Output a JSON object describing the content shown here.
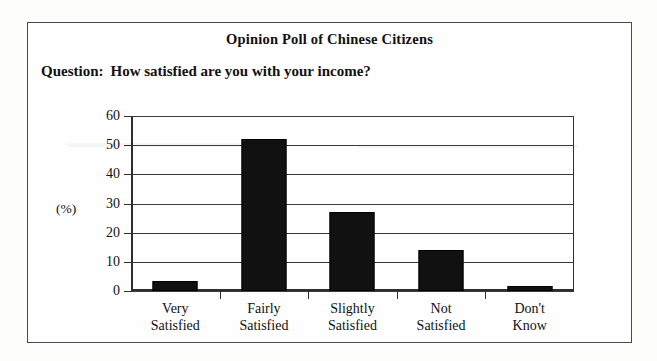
{
  "chart_data": {
    "type": "bar",
    "title": "Opinion Poll of Chinese Citizens",
    "subtitle_label": "Question:",
    "subtitle_text": "How satisfied are you with your income?",
    "categories": [
      "Very Satisfied",
      "Fairly Satisfied",
      "Slightly Satisfied",
      "Not Satisfied",
      "Don't Know"
    ],
    "category_lines": [
      [
        "Very",
        "Satisfied"
      ],
      [
        "Fairly",
        "Satisfied"
      ],
      [
        "Slightly",
        "Satisfied"
      ],
      [
        "Not",
        "Satisfied"
      ],
      [
        "Don't",
        "Know"
      ]
    ],
    "values": [
      3.5,
      52,
      27,
      14,
      1.7
    ],
    "xlabel": "",
    "ylabel": "(%)",
    "ylim": [
      0,
      60
    ],
    "yticks": [
      0,
      10,
      20,
      30,
      40,
      50,
      60
    ],
    "ytick_labels": [
      "0",
      "10",
      "20",
      "30",
      "40",
      "50",
      "60"
    ],
    "grid": true,
    "legend": false,
    "bar_color": "#111111",
    "axis_color": "#2e2e2e",
    "background_color": "#fefefe"
  }
}
